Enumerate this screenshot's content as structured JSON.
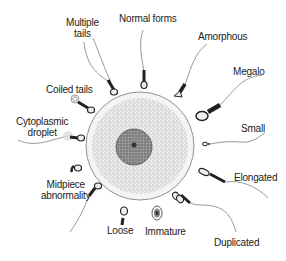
{
  "diagram": {
    "center": {
      "label": "oocyte",
      "nucleus": "nucleus"
    },
    "labels": {
      "multiple_tails": [
        "Multiple",
        "tails"
      ],
      "normal_forms": "Normal forms",
      "amorphous": "Amorphous",
      "megalo": "Megalo",
      "coiled_tails": "Coiled tails",
      "cytoplasmic_droplet": [
        "Cytoplasmic",
        "droplet"
      ],
      "small": "Small",
      "elongated": "Elongated",
      "midpiece_abnormality": [
        "Midpiece",
        "abnormality"
      ],
      "loose": "Loose",
      "immature": "Immature",
      "duplicated": "Duplicated"
    },
    "colors": {
      "outline": "#555555",
      "head_dark": "#222222",
      "head_light": "#eeeeee",
      "cytoplasm": "#d8d8d8",
      "nucleus": "#888888"
    }
  }
}
